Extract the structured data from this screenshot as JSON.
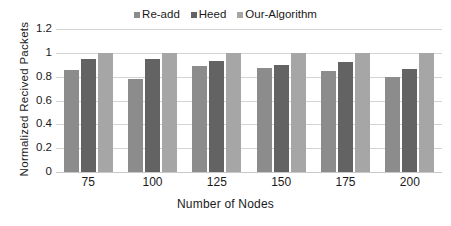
{
  "chart_data": {
    "type": "bar",
    "title": "",
    "xlabel": "Number of Nodes",
    "ylabel": "Normalized Recived Packets",
    "categories": [
      "75",
      "100",
      "125",
      "150",
      "175",
      "200"
    ],
    "series": [
      {
        "name": "Re-add",
        "color": "#8c8c8c",
        "values": [
          0.855,
          0.78,
          0.89,
          0.875,
          0.85,
          0.8
        ]
      },
      {
        "name": "Heed",
        "color": "#636363",
        "values": [
          0.95,
          0.945,
          0.93,
          0.9,
          0.92,
          0.865
        ]
      },
      {
        "name": "Our-Algorithm",
        "color": "#a6a6a6",
        "values": [
          1.0,
          1.0,
          1.0,
          1.0,
          1.0,
          1.0
        ]
      }
    ],
    "yticks": [
      "0",
      "0.2",
      "0.4",
      "0.6",
      "0.8",
      "1",
      "1.2"
    ],
    "ytick_values": [
      0,
      0.2,
      0.4,
      0.6,
      0.8,
      1.0,
      1.2
    ],
    "ylim": [
      0,
      1.2
    ],
    "grid": true,
    "legend_position": "top-center",
    "gridline_color": "#d4d4d4",
    "background": "#ffffff"
  }
}
